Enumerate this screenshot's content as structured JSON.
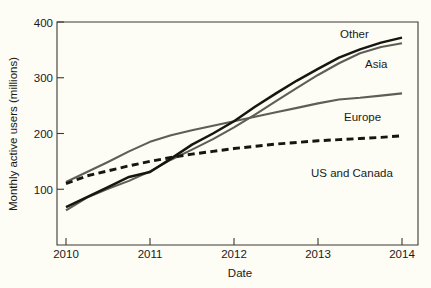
{
  "chart_data": {
    "type": "line",
    "title": "",
    "xlabel": "Date",
    "ylabel": "Monthly active users (millions)",
    "xlim": [
      2010,
      2014
    ],
    "ylim": [
      60,
      400
    ],
    "grid": false,
    "legend_position": "inline-right-end-labels",
    "x_tick_labels": [
      "2010",
      "2011",
      "2012",
      "2013",
      "2014"
    ],
    "x_ticks": [
      2010,
      2011,
      2012,
      2013,
      2014
    ],
    "y_tick_labels": [
      "100",
      "200",
      "300",
      "400"
    ],
    "y_ticks": [
      100,
      200,
      300,
      400
    ],
    "x": [
      2010.0,
      2010.25,
      2010.5,
      2010.75,
      2011.0,
      2011.25,
      2011.5,
      2011.75,
      2012.0,
      2012.25,
      2012.5,
      2012.75,
      2013.0,
      2013.25,
      2013.5,
      2013.75,
      2014.0
    ],
    "series": [
      {
        "name": "Other",
        "label": "Other",
        "style": "solid",
        "color": "#17150f",
        "width": "thick",
        "values": [
          68,
          86,
          104,
          122,
          131,
          155,
          180,
          200,
          222,
          248,
          272,
          295,
          316,
          336,
          351,
          363,
          372
        ]
      },
      {
        "name": "Asia",
        "label": "Asia",
        "style": "solid",
        "color": "#5e5d57",
        "width": "medium",
        "values": [
          62,
          85,
          101,
          115,
          132,
          153,
          171,
          190,
          211,
          234,
          258,
          282,
          305,
          326,
          344,
          355,
          362
        ]
      },
      {
        "name": "Europe",
        "label": "Europe",
        "style": "solid",
        "color": "#5e5d57",
        "width": "medium",
        "values": [
          113,
          131,
          149,
          168,
          185,
          197,
          206,
          214,
          222,
          230,
          238,
          246,
          254,
          261,
          264,
          268,
          272
        ]
      },
      {
        "name": "US and Canada",
        "label": "US and Canada",
        "style": "dashed",
        "color": "#17150f",
        "width": "thick",
        "values": [
          110,
          124,
          133,
          142,
          150,
          157,
          163,
          168,
          173,
          177,
          181,
          184,
          187,
          189,
          191,
          193,
          196
        ]
      }
    ],
    "annotations": [
      {
        "text": "Other",
        "x": 2013.25,
        "y": 382
      },
      {
        "text": "Asia",
        "x": 2013.55,
        "y": 330
      },
      {
        "text": "Europe",
        "x": 2013.35,
        "y": 248
      },
      {
        "text": "US and Canada",
        "x": 2013.0,
        "y": 172
      }
    ]
  },
  "colors": {
    "background": "#fdfcf5",
    "axis": "#3b3a33",
    "dark_series": "#17150f",
    "gray_series": "#5e5d57",
    "text": "#1a1a18"
  }
}
